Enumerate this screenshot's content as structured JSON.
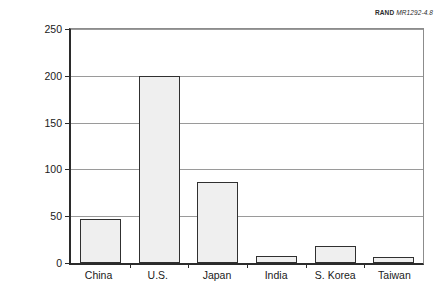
{
  "figure": {
    "source_tag": {
      "brand": "RAND",
      "document_id": "MR1292-4.8"
    }
  },
  "chart_data": {
    "type": "bar",
    "title": "",
    "xlabel": "",
    "ylabel": "Billions of 1996 PPP dollars",
    "categories": [
      "China",
      "U.S.",
      "Japan",
      "India",
      "S. Korea",
      "Taiwan"
    ],
    "values": [
      46,
      197,
      85,
      7,
      18,
      6
    ],
    "ylim": [
      0,
      250
    ],
    "yticks": [
      0,
      50,
      100,
      150,
      200,
      250
    ],
    "ytick_labels": [
      "0",
      "50",
      "100",
      "150",
      "200",
      "250"
    ],
    "grid": "horizontal",
    "legend": "none",
    "bar_fill_color": "#efefef",
    "bar_edge_color": "#303030",
    "axis_color": "#2b2b2b",
    "gridline_color": "#9a9a9a"
  }
}
